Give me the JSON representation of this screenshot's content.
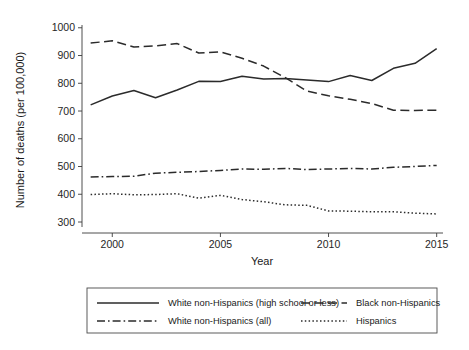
{
  "chart_data": {
    "type": "line",
    "title": "",
    "xlabel": "Year",
    "ylabel": "Number of deaths (per 100,000)",
    "xlim": [
      1998.6,
      2015.2
    ],
    "ylim": [
      282,
      1010
    ],
    "grid": false,
    "legend_position": "bottom",
    "x": [
      1999,
      2000,
      2001,
      2002,
      2003,
      2004,
      2005,
      2006,
      2007,
      2008,
      2009,
      2010,
      2011,
      2012,
      2013,
      2014,
      2015
    ],
    "xticks": [
      "2000",
      "2005",
      "2010",
      "2015"
    ],
    "xtick_values": [
      2000,
      2005,
      2010,
      2015
    ],
    "yticks": [
      "300",
      "400",
      "500",
      "600",
      "700",
      "800",
      "900",
      "1000"
    ],
    "ytick_values": [
      300,
      400,
      500,
      600,
      700,
      800,
      900,
      1000
    ],
    "series": [
      {
        "name": "White non-Hispanics (high school or less)",
        "style": "solid",
        "values": [
          722,
          754,
          774,
          748,
          776,
          807,
          806,
          825,
          815,
          817,
          812,
          806,
          828,
          810,
          854,
          872,
          925
        ]
      },
      {
        "name": "Black non-Hispanics",
        "style": "dashed",
        "values": [
          945,
          953,
          931,
          935,
          943,
          909,
          913,
          890,
          862,
          820,
          772,
          755,
          742,
          727,
          703,
          702,
          703
        ]
      },
      {
        "name": "White non-Hispanics (all)",
        "style": "dashdot",
        "values": [
          462,
          464,
          465,
          476,
          479,
          482,
          486,
          491,
          490,
          493,
          489,
          491,
          493,
          491,
          497,
          500,
          504
        ]
      },
      {
        "name": "Hispanics",
        "style": "dotted",
        "values": [
          399,
          402,
          398,
          399,
          402,
          386,
          396,
          381,
          373,
          362,
          360,
          340,
          339,
          337,
          337,
          332,
          329
        ]
      }
    ]
  },
  "legend": {
    "entries": [
      {
        "label": "White non-Hispanics (high school or less)",
        "style": "solid"
      },
      {
        "label": "Black non-Hispanics",
        "style": "dashed"
      },
      {
        "label": "White non-Hispanics (all)",
        "style": "dashdot"
      },
      {
        "label": "Hispanics",
        "style": "dotted"
      }
    ]
  }
}
